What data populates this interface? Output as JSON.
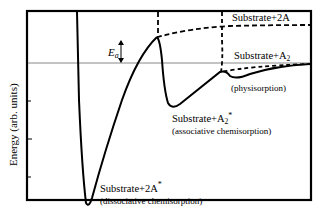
{
  "diagram": {
    "y_axis_label": "Energy (arb. units)",
    "activation_label": "E",
    "activation_subscript": "a",
    "colors": {
      "curve": "#000000",
      "reference_line": "#888888",
      "frame": "#000000",
      "background": "#ffffff"
    },
    "labels": {
      "gas_dissociated": "Substrate+2A",
      "gas_molecular_main": "Substrate+A",
      "gas_molecular_sub": "2",
      "physisorption": "(physisorption)",
      "assoc_main": "Substrate+A",
      "assoc_sub": "2",
      "assoc_sup": "*",
      "assoc_note": "(associative chemisorption)",
      "dissoc_main": "Substrate+2A",
      "dissoc_sup": "*",
      "dissoc_note": "(dissociative chemisorption)"
    },
    "curves": [
      {
        "name": "dissociative-chemisorption",
        "style": "solid"
      },
      {
        "name": "associative-chemisorption",
        "style": "solid"
      },
      {
        "name": "physisorption",
        "style": "solid"
      },
      {
        "name": "substrate-2A-asymptote",
        "style": "dashed"
      },
      {
        "name": "substrate-A2-asymptote",
        "style": "dashed"
      }
    ]
  }
}
